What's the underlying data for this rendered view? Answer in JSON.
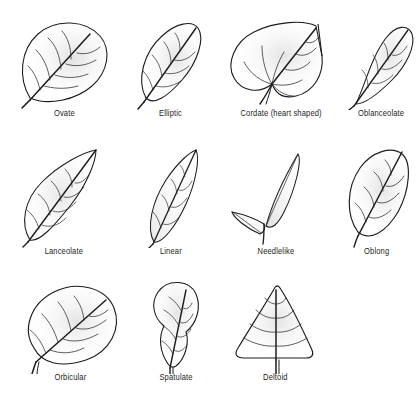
{
  "figure": {
    "type": "botanical-illustration-plate",
    "background_color": "#ffffff",
    "ink_color": "#1c1c1c",
    "shading_color": "#b9b9b9",
    "rows": [
      4,
      4,
      3
    ],
    "total_items": 11
  },
  "leaves": [
    {
      "id": "ovate",
      "label": "Ovate",
      "row": 1,
      "column": 1,
      "description": "Broad egg-shaped blade, widest below the middle, tapering to a pointed tip, tilted to the right."
    },
    {
      "id": "elliptic",
      "label": "Elliptic",
      "row": 1,
      "column": 2,
      "description": "Oval blade widest at the middle, tapering equally to base and tip."
    },
    {
      "id": "cordate",
      "label": "Cordate (heart shaped)",
      "row": 1,
      "column": 3,
      "description": "Heart shaped with a notched base forming two rounded basal lobes and a pointed tip."
    },
    {
      "id": "oblanceolate",
      "label": "Oblanceolate",
      "row": 1,
      "column": 4,
      "description": "Narrow blade widest near the tip, tapering gradually to a long narrow base."
    },
    {
      "id": "lanceolate",
      "label": "Lanceolate",
      "row": 2,
      "column": 1,
      "description": "Lance shaped, widest near the base and tapering to a long pointed tip."
    },
    {
      "id": "linear",
      "label": "Linear",
      "row": 2,
      "column": 2,
      "description": "Long and very narrow with nearly parallel sides."
    },
    {
      "id": "needlelike",
      "label": "Needlelike",
      "row": 2,
      "column": 3,
      "description": "Two slender needles joined at a common base, one long and upright, one short and angled downward."
    },
    {
      "id": "oblong",
      "label": "Oblong",
      "row": 2,
      "column": 4,
      "description": "Elongated blade with nearly parallel sides and rounded ends."
    },
    {
      "id": "orbicular",
      "label": "Orbicular",
      "row": 3,
      "column": 1,
      "description": "Nearly circular blade with a short stalk at the base."
    },
    {
      "id": "spatulate",
      "label": "Spatulate",
      "row": 3,
      "column": 2,
      "description": "Spoon shaped, broad and rounded at the tip narrowing to a slender base."
    },
    {
      "id": "deltoid",
      "label": "Deltoid",
      "row": 3,
      "column": 3,
      "description": "Triangular blade with a broad straight base and a pointed apex."
    }
  ]
}
